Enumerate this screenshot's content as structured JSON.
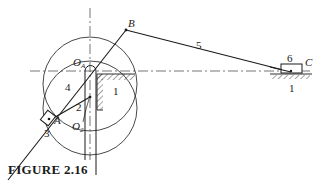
{
  "caption": "FIGURE 2.16",
  "labels": {
    "B": "B",
    "C": "C",
    "A": "A",
    "OA": "O",
    "OA_sub": "A",
    "O2": "O",
    "O2_sub": "2",
    "link1_frame": "1",
    "link1_ground": "1",
    "link2": "2",
    "link3": "3",
    "link4": "4",
    "link5": "5",
    "link6": "6"
  },
  "colors": {
    "ink": "#1a1a1a",
    "background": "#ffffff"
  }
}
